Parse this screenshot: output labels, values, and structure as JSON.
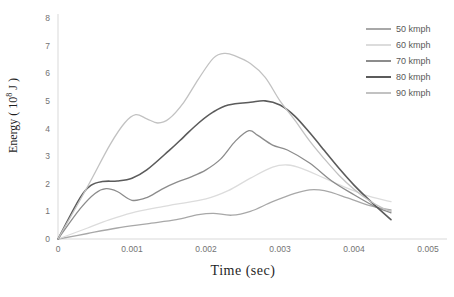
{
  "chart_data": {
    "type": "line",
    "title": "",
    "xlabel": "Time (sec)",
    "ylabel": "Energy ( 10^8 J )",
    "ylabel_parts": {
      "prefix": "Energy ( 10",
      "superscript": "8",
      "suffix": " J )"
    },
    "xlim": [
      0,
      0.005
    ],
    "ylim": [
      0,
      8
    ],
    "x_tick_values": [
      0,
      0.001,
      0.002,
      0.003,
      0.004,
      0.005
    ],
    "x_tick_labels": [
      "0",
      "0.001",
      "0.002",
      "0.003",
      "0.004",
      "0.005"
    ],
    "y_tick_values": [
      0,
      1,
      2,
      3,
      4,
      5,
      6,
      7,
      8
    ],
    "y_tick_labels": [
      "0",
      "1",
      "2",
      "3",
      "4",
      "5",
      "6",
      "7",
      "8"
    ],
    "grid": false,
    "legend_position": "top-right",
    "axis_color": "#d9d9d9",
    "tick_label_color": "#737373",
    "series": [
      {
        "name": "50 kmph",
        "color": "#a8a8a8",
        "width": 1.3,
        "points": [
          [
            0,
            0
          ],
          [
            0.0004,
            0.2
          ],
          [
            0.0008,
            0.4
          ],
          [
            0.0012,
            0.55
          ],
          [
            0.0016,
            0.7
          ],
          [
            0.0019,
            0.88
          ],
          [
            0.0021,
            0.93
          ],
          [
            0.00235,
            0.86
          ],
          [
            0.0026,
            1.0
          ],
          [
            0.0029,
            1.35
          ],
          [
            0.0032,
            1.65
          ],
          [
            0.0034,
            1.78
          ],
          [
            0.0036,
            1.75
          ],
          [
            0.0039,
            1.5
          ],
          [
            0.0042,
            1.22
          ],
          [
            0.0045,
            1.05
          ]
        ]
      },
      {
        "name": "60 kmph",
        "color": "#dcdcdc",
        "width": 1.3,
        "points": [
          [
            0,
            0
          ],
          [
            0.0004,
            0.4
          ],
          [
            0.0007,
            0.7
          ],
          [
            0.001,
            0.95
          ],
          [
            0.0013,
            1.12
          ],
          [
            0.0016,
            1.26
          ],
          [
            0.002,
            1.45
          ],
          [
            0.0023,
            1.75
          ],
          [
            0.0026,
            2.2
          ],
          [
            0.0029,
            2.6
          ],
          [
            0.0031,
            2.68
          ],
          [
            0.0033,
            2.55
          ],
          [
            0.0036,
            2.2
          ],
          [
            0.0039,
            1.85
          ],
          [
            0.0042,
            1.55
          ],
          [
            0.0045,
            1.35
          ]
        ]
      },
      {
        "name": "70 kmph",
        "color": "#8c8c8c",
        "width": 1.3,
        "points": [
          [
            0,
            0
          ],
          [
            0.0003,
            1.1
          ],
          [
            0.0005,
            1.65
          ],
          [
            0.00065,
            1.82
          ],
          [
            0.0008,
            1.72
          ],
          [
            0.001,
            1.4
          ],
          [
            0.0012,
            1.5
          ],
          [
            0.0014,
            1.8
          ],
          [
            0.0016,
            2.05
          ],
          [
            0.0018,
            2.25
          ],
          [
            0.002,
            2.5
          ],
          [
            0.0022,
            2.9
          ],
          [
            0.0024,
            3.55
          ],
          [
            0.00258,
            3.92
          ],
          [
            0.0027,
            3.75
          ],
          [
            0.0029,
            3.4
          ],
          [
            0.0031,
            3.22
          ],
          [
            0.0034,
            2.75
          ],
          [
            0.0037,
            2.1
          ],
          [
            0.004,
            1.6
          ],
          [
            0.0043,
            1.15
          ],
          [
            0.0045,
            0.95
          ]
        ]
      },
      {
        "name": "80 kmph",
        "color": "#5b5b5b",
        "width": 1.6,
        "points": [
          [
            0,
            0
          ],
          [
            0.0003,
            1.5
          ],
          [
            0.00045,
            1.95
          ],
          [
            0.0006,
            2.08
          ],
          [
            0.0008,
            2.1
          ],
          [
            0.001,
            2.2
          ],
          [
            0.0012,
            2.5
          ],
          [
            0.0015,
            3.2
          ],
          [
            0.0017,
            3.7
          ],
          [
            0.0019,
            4.2
          ],
          [
            0.0021,
            4.6
          ],
          [
            0.0023,
            4.85
          ],
          [
            0.0026,
            4.95
          ],
          [
            0.0028,
            5.0
          ],
          [
            0.003,
            4.85
          ],
          [
            0.0032,
            4.45
          ],
          [
            0.0034,
            3.85
          ],
          [
            0.0036,
            3.2
          ],
          [
            0.0038,
            2.55
          ],
          [
            0.004,
            1.95
          ],
          [
            0.00425,
            1.3
          ],
          [
            0.0045,
            0.7
          ]
        ]
      },
      {
        "name": "90 kmph",
        "color": "#c2c2c2",
        "width": 1.3,
        "points": [
          [
            0,
            0
          ],
          [
            0.0004,
            1.9
          ],
          [
            0.0007,
            3.4
          ],
          [
            0.0009,
            4.2
          ],
          [
            0.00105,
            4.5
          ],
          [
            0.0012,
            4.35
          ],
          [
            0.00135,
            4.2
          ],
          [
            0.0015,
            4.35
          ],
          [
            0.0017,
            4.95
          ],
          [
            0.0019,
            5.8
          ],
          [
            0.0021,
            6.55
          ],
          [
            0.00225,
            6.72
          ],
          [
            0.0024,
            6.62
          ],
          [
            0.0026,
            6.35
          ],
          [
            0.0028,
            5.85
          ],
          [
            0.003,
            5.0
          ],
          [
            0.0032,
            4.3
          ],
          [
            0.0034,
            3.55
          ],
          [
            0.0036,
            2.9
          ],
          [
            0.0038,
            2.3
          ],
          [
            0.004,
            1.8
          ],
          [
            0.0042,
            1.4
          ],
          [
            0.0044,
            1.1
          ],
          [
            0.0045,
            1.0
          ]
        ]
      }
    ]
  }
}
